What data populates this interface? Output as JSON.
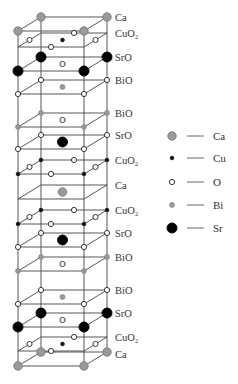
{
  "diagram": {
    "geometry": {
      "back_left_x": 41,
      "back_right_x": 107,
      "front_left_x": 18,
      "front_right_x": 84,
      "depth_dy": 14,
      "label_x": 115
    },
    "atom_styles": {
      "Ca": {
        "r": 4.2,
        "fill": "#9a9a9a",
        "stroke": "#777777"
      },
      "Cu": {
        "r": 1.8,
        "fill": "#111111",
        "stroke": "#111111"
      },
      "O": {
        "r": 2.6,
        "fill": "#ffffff",
        "stroke": "#222222"
      },
      "Bi": {
        "r": 2.4,
        "fill": "#9a9a9a",
        "stroke": "#888888"
      },
      "Sr": {
        "r": 5.0,
        "fill": "#000000",
        "stroke": "#000000"
      }
    },
    "layers": [
      {
        "label": "Ca",
        "back_y": 17,
        "corners": "Ca",
        "center": null,
        "edges": null,
        "label_y": 21
      },
      {
        "label": "CuO₂",
        "back_y": 33,
        "corners": null,
        "center": "Cu",
        "edges": "O",
        "label_y": 37
      },
      {
        "label": "SrO",
        "back_y": 57,
        "corners": "Sr",
        "center": "O",
        "edges": null,
        "label_y": 61
      },
      {
        "label": "BiO",
        "back_y": 80,
        "corners": "O",
        "center": "Bi",
        "edges": null,
        "label_y": 84
      },
      {
        "label": "BiO",
        "back_y": 113,
        "corners": "Bi",
        "center": "O",
        "edges": null,
        "label_y": 117
      },
      {
        "label": "SrO",
        "back_y": 135,
        "corners": "O",
        "center": "Sr",
        "edges": null,
        "label_y": 139
      },
      {
        "label": "CuO₂",
        "back_y": 160,
        "corners": "Cu",
        "center": null,
        "edges": "O",
        "label_y": 164
      },
      {
        "label": "Ca",
        "back_y": 185,
        "corners": null,
        "center": "Ca",
        "edges": null,
        "label_y": 189
      },
      {
        "label": "CuO₂",
        "back_y": 210,
        "corners": "Cu",
        "center": null,
        "edges": "O",
        "label_y": 214
      },
      {
        "label": "SrO",
        "back_y": 233,
        "corners": "O",
        "center": "Sr",
        "edges": null,
        "label_y": 237
      },
      {
        "label": "BiO",
        "back_y": 257,
        "corners": "Bi",
        "center": "O",
        "edges": null,
        "label_y": 261
      },
      {
        "label": "BiO",
        "back_y": 290,
        "corners": "O",
        "center": "Bi",
        "edges": null,
        "label_y": 294
      },
      {
        "label": "SrO",
        "back_y": 313,
        "corners": "Sr",
        "center": "O",
        "edges": null,
        "label_y": 317
      },
      {
        "label": "CuO₂",
        "back_y": 337,
        "corners": null,
        "center": "Cu",
        "edges": "O",
        "label_y": 341
      },
      {
        "label": "Ca",
        "back_y": 352,
        "corners": "Ca",
        "center": null,
        "edges": null,
        "label_y": 358
      }
    ]
  },
  "legend": {
    "items": [
      {
        "element": "Ca",
        "label": "Ca",
        "y": 136
      },
      {
        "element": "Cu",
        "label": "Cu",
        "y": 158
      },
      {
        "element": "O",
        "label": "O",
        "y": 182
      },
      {
        "element": "Bi",
        "label": "Bi",
        "y": 205
      },
      {
        "element": "Sr",
        "label": "Sr",
        "y": 228
      }
    ],
    "symbol_x": 172,
    "line_x1": 187,
    "line_x2": 204,
    "label_x": 213
  }
}
